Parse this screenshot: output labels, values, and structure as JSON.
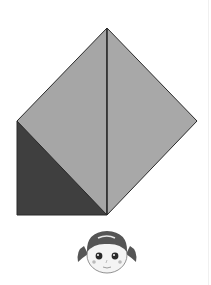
{
  "diagram": {
    "type": "origami-fold-step",
    "colors": {
      "background": "#ffffff",
      "paper_front": "#a6a6a6",
      "paper_back": "#3f3f3f",
      "outline": "#2a2a2a"
    },
    "shapes": {
      "left_face": "107,28 17,121 107,215",
      "right_face": "107,28 197,121 107,215",
      "dark_corner": "17,121 17,215 107,215",
      "center_crease": {
        "x1": 107,
        "y1": 28,
        "x2": 107,
        "y2": 215
      }
    }
  },
  "character": {
    "name": "girl-with-pigtails",
    "position": {
      "cx": 107,
      "cy": 253
    }
  }
}
